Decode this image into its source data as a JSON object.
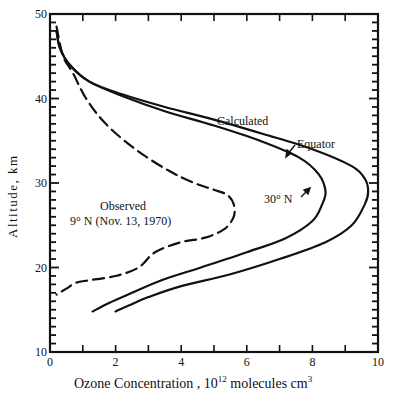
{
  "chart_data": {
    "type": "line",
    "title": "",
    "xlabel": "Ozone Concentration, 10^12 molecules cm^3",
    "xlabel_parts": {
      "main": "Ozone  Concentration ,  10",
      "sup": "12",
      "unit": " molecules  cm",
      "unit_sup": "3"
    },
    "ylabel": "Altitude, km",
    "xlim": [
      0,
      10
    ],
    "ylim": [
      10,
      50
    ],
    "x_ticks": [
      "0",
      "2",
      "4",
      "6",
      "8",
      "10"
    ],
    "y_ticks": [
      "10",
      "20",
      "30",
      "40",
      "50"
    ],
    "grid": false,
    "legend": "inline annotations",
    "annotations": {
      "calculated": "Calculated",
      "equator": "Equator",
      "thirty_n": "30° N",
      "observed_line1": "Observed",
      "observed_line2": "9° N (Nov. 13, 1970)"
    },
    "series": [
      {
        "name": "Calculated Equator",
        "style": "solid",
        "points": [
          [
            0.2,
            48
          ],
          [
            0.3,
            46
          ],
          [
            0.6,
            44
          ],
          [
            1.2,
            42
          ],
          [
            2.2,
            40.5
          ],
          [
            3.5,
            39
          ],
          [
            5,
            37.5
          ],
          [
            6.5,
            35.8
          ],
          [
            8,
            34
          ],
          [
            9.2,
            32
          ],
          [
            9.6,
            30.5
          ],
          [
            9.7,
            29
          ],
          [
            9.6,
            27.5
          ],
          [
            9.2,
            25
          ],
          [
            8.4,
            23
          ],
          [
            7,
            21
          ],
          [
            5.5,
            19.2
          ],
          [
            4,
            17.8
          ],
          [
            3,
            16.5
          ],
          [
            2.4,
            15.5
          ],
          [
            2,
            14.8
          ]
        ]
      },
      {
        "name": "Calculated 30° N",
        "style": "solid",
        "points": [
          [
            0.2,
            48
          ],
          [
            0.3,
            46
          ],
          [
            0.6,
            44
          ],
          [
            1.2,
            42
          ],
          [
            2.2,
            40.3
          ],
          [
            3.5,
            38.5
          ],
          [
            5,
            36.8
          ],
          [
            6.4,
            35
          ],
          [
            7.6,
            33
          ],
          [
            8.2,
            31
          ],
          [
            8.4,
            29
          ],
          [
            8.3,
            27.5
          ],
          [
            8,
            25.5
          ],
          [
            7.2,
            23.5
          ],
          [
            6,
            21.8
          ],
          [
            4.6,
            20
          ],
          [
            3.4,
            18.5
          ],
          [
            2.5,
            17
          ],
          [
            1.8,
            15.8
          ],
          [
            1.3,
            14.8
          ]
        ]
      },
      {
        "name": "Observed 9° N (Nov. 13, 1970)",
        "style": "dashed",
        "points": [
          [
            0.2,
            48.5
          ],
          [
            0.4,
            45
          ],
          [
            0.7,
            43
          ],
          [
            1.1,
            40
          ],
          [
            1.7,
            37
          ],
          [
            2.6,
            34
          ],
          [
            3.6,
            31.5
          ],
          [
            4.4,
            30
          ],
          [
            5,
            29.2
          ],
          [
            5.4,
            28.6
          ],
          [
            5.6,
            27.5
          ],
          [
            5.6,
            26
          ],
          [
            5.3,
            24.5
          ],
          [
            4.7,
            23.5
          ],
          [
            4,
            23
          ],
          [
            3.2,
            21.8
          ],
          [
            2.7,
            20
          ],
          [
            2,
            19
          ],
          [
            1.2,
            18.5
          ],
          [
            0.8,
            18.2
          ],
          [
            0.5,
            17.5
          ],
          [
            0.2,
            16.8
          ]
        ]
      }
    ]
  },
  "figure_caption_fragment": "..."
}
